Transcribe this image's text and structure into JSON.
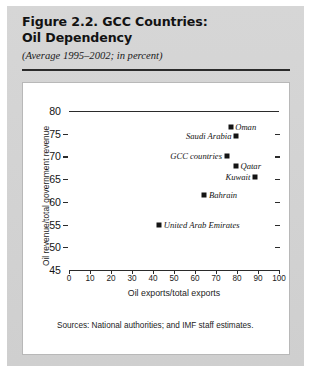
{
  "figure": {
    "title_line1": "Figure 2.2. GCC Countries:",
    "title_line2": "Oil Dependency",
    "subtitle": "(Average 1995–2002; in percent)",
    "sources": "Sources: National authorities; and IMF staff estimates."
  },
  "chart_data": {
    "type": "scatter",
    "title": "Figure 2.2. GCC Countries: Oil Dependency",
    "subtitle": "(Average 1995–2002; in percent)",
    "xlabel": "Oil exports/total exports",
    "ylabel": "Oil revenue/total government revenue",
    "xlim": [
      0,
      100
    ],
    "ylim": [
      45,
      80
    ],
    "xticks": [
      0,
      10,
      20,
      30,
      40,
      50,
      60,
      70,
      80,
      90,
      100
    ],
    "yticks": [
      45,
      50,
      55,
      60,
      65,
      70,
      75,
      80
    ],
    "grid": false,
    "legend": "none",
    "marker_color": "#141414",
    "points": [
      {
        "name": "Oman",
        "x": 77.0,
        "y": 76.5,
        "label_side": "right"
      },
      {
        "name": "Saudi Arabia",
        "x": 79.5,
        "y": 74.5,
        "label_side": "left"
      },
      {
        "name": "GCC countries",
        "x": 75.0,
        "y": 70.0,
        "label_side": "left"
      },
      {
        "name": "Qatar",
        "x": 79.5,
        "y": 67.8,
        "label_side": "right"
      },
      {
        "name": "Kuwait",
        "x": 88.5,
        "y": 65.5,
        "label_side": "left"
      },
      {
        "name": "Bahrain",
        "x": 64.5,
        "y": 61.5,
        "label_side": "right"
      },
      {
        "name": "United Arab Emirates",
        "x": 43.0,
        "y": 54.8,
        "label_side": "right"
      }
    ]
  }
}
